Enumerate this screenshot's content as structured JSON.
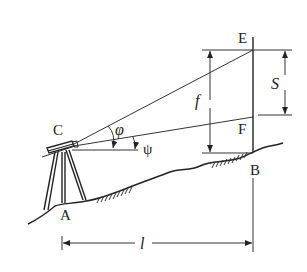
{
  "diagram": {
    "type": "surveying-stadia-inclined-sight",
    "labels": {
      "E": "E",
      "F": "F",
      "B": "B",
      "C": "C",
      "A": "A",
      "f": "f",
      "S": "S",
      "l": "l",
      "phi": "φ",
      "psi": "ψ"
    },
    "elements": [
      "tripod-instrument at C over point A",
      "leveling staff at B with reading points E and F",
      "sight line C-E",
      "sight line C-F",
      "horizontal line from C",
      "ground profile",
      "dimension f (height from B to E)",
      "dimension S (staff interval E-F)",
      "dimension l (horizontal distance A-B)"
    ],
    "colors": {
      "line": "#333333",
      "background": "#ffffff"
    }
  }
}
